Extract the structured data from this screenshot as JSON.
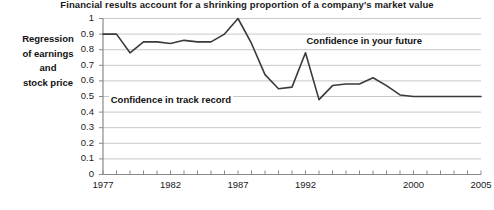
{
  "chart_data": {
    "type": "line",
    "title": "Financial results account for a shrinking proportion of a company's market value",
    "xlabel": "",
    "ylabel": "Regression of earnings and stock price",
    "ylabel_lines": [
      "Regression",
      "of earnings",
      "and",
      "stock price"
    ],
    "ylim": [
      0,
      1
    ],
    "xlim": [
      1977,
      2005
    ],
    "grid": true,
    "legend": "none",
    "y_ticks": [
      "1",
      "0.9",
      "0.8",
      "0.7",
      "0.6",
      "0.5",
      "0.4",
      "0.3",
      "0.2",
      "0.1",
      "0"
    ],
    "y_tick_values": [
      1,
      0.9,
      0.8,
      0.7,
      0.6,
      0.5,
      0.4,
      0.3,
      0.2,
      0.1,
      0
    ],
    "x_ticks": [
      "1977",
      "1982",
      "1987",
      "1992",
      "2000",
      "2005"
    ],
    "x_tick_values": [
      1977,
      1982,
      1987,
      1992,
      2000,
      2005
    ],
    "line_color": "#3a3a3a",
    "grid_color": "#c8c8c8",
    "axis_color": "#9a9a9a",
    "x": [
      1977,
      1978,
      1979,
      1980,
      1981,
      1982,
      1983,
      1984,
      1985,
      1986,
      1987,
      1988,
      1989,
      1990,
      1991,
      1992,
      1993,
      1994,
      1995,
      1996,
      1997,
      1998,
      1999,
      2000,
      2001,
      2002,
      2003,
      2004,
      2005
    ],
    "values": [
      0.9,
      0.9,
      0.78,
      0.85,
      0.85,
      0.84,
      0.86,
      0.85,
      0.85,
      0.9,
      1.0,
      0.84,
      0.64,
      0.55,
      0.56,
      0.78,
      0.48,
      0.57,
      0.58,
      0.58,
      0.62,
      0.57,
      0.51,
      0.5,
      0.5,
      0.5,
      0.5,
      0.5,
      0.5
    ],
    "annotations": [
      {
        "text": "Confidence in your future",
        "x": 1996,
        "y": 0.85
      },
      {
        "text": "Confidence in track record",
        "x": 1981.5,
        "y": 0.47
      }
    ]
  }
}
